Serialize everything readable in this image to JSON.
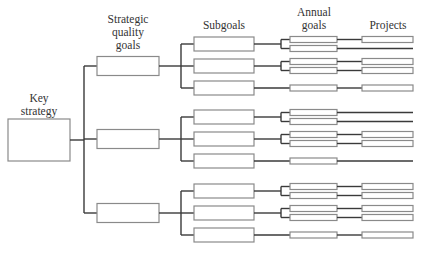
{
  "headers": {
    "key_strategy": [
      "Key",
      "strategy"
    ],
    "strategic_quality_goals": [
      "Strategic",
      "quality",
      "goals"
    ],
    "subgoals": [
      "Subgoals"
    ],
    "annual_goals": [
      "Annual",
      "goals"
    ],
    "projects": [
      "Projects"
    ]
  },
  "colors": {
    "line": "#3a3a3a",
    "box_border": "#8a8a8a",
    "box_fill": "#ffffff",
    "text": "#333333"
  },
  "tree": {
    "strategic_goals": [
      {
        "subgoals": [
          {
            "annual_goals": [
              {
                "project": true
              },
              {
                "project": false
              }
            ]
          },
          {
            "annual_goals": [
              {
                "project": true
              },
              {
                "project": true
              }
            ]
          },
          {
            "annual_goals": [
              {
                "project": true
              }
            ]
          }
        ]
      },
      {
        "subgoals": [
          {
            "annual_goals": [
              {
                "project": false
              },
              {
                "project": false
              }
            ]
          },
          {
            "annual_goals": [
              {
                "project": true
              },
              {
                "project": true
              }
            ]
          },
          {
            "annual_goals": [
              {
                "project": false
              }
            ]
          }
        ]
      },
      {
        "subgoals": [
          {
            "annual_goals": [
              {
                "project": true
              },
              {
                "project": true
              }
            ]
          },
          {
            "annual_goals": [
              {
                "project": true
              },
              {
                "project": true
              }
            ]
          },
          {
            "annual_goals": [
              {
                "project": true
              }
            ]
          }
        ]
      }
    ]
  }
}
